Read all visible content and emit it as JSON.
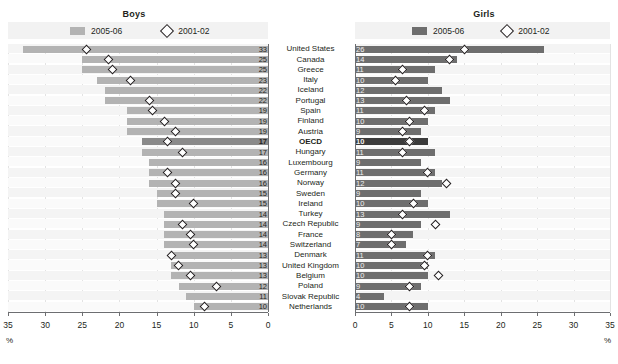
{
  "panels": {
    "boys": {
      "title": "Boys",
      "legend": {
        "bar_label": "2005-06",
        "marker_label": "2001-02",
        "bar_color": "#b3b3b3",
        "marker": "diamond"
      },
      "axis": {
        "ticks": [
          "35",
          "30",
          "25",
          "20",
          "15",
          "10",
          "5",
          "0"
        ],
        "min": 0,
        "max": 35,
        "unit": "%",
        "direction": "right-to-left"
      }
    },
    "girls": {
      "title": "Girls",
      "legend": {
        "bar_label": "2005-06",
        "marker_label": "2001-02",
        "bar_color": "#6e6e6e",
        "marker": "diamond"
      },
      "axis": {
        "ticks": [
          "0",
          "5",
          "10",
          "15",
          "20",
          "25",
          "30",
          "35"
        ],
        "min": 0,
        "max": 35,
        "unit": "%",
        "direction": "left-to-right"
      }
    }
  },
  "chart_data": {
    "type": "bar",
    "xlabel": "%",
    "ylabel": "",
    "xlim": [
      0,
      35
    ],
    "grid": true,
    "legend_position": "top",
    "categories": [
      "United States",
      "Canada",
      "Greece",
      "Italy",
      "Iceland",
      "Portugal",
      "Spain",
      "Finland",
      "Austria",
      "OECD",
      "Hungary",
      "Luxembourg",
      "Germany",
      "Norway",
      "Sweden",
      "Ireland",
      "Turkey",
      "Czech Republic",
      "France",
      "Switzerland",
      "Denmark",
      "United Kingdom",
      "Belgium",
      "Poland",
      "Slovak Republic",
      "Netherlands"
    ],
    "highlight_category": "OECD",
    "series": [
      {
        "name": "Boys 2005-06",
        "panel": "boys",
        "type": "bar",
        "values": [
          33,
          25,
          25,
          23,
          22,
          22,
          19,
          19,
          19,
          17,
          17,
          16,
          16,
          16,
          15,
          15,
          14,
          14,
          14,
          14,
          13,
          13,
          13,
          12,
          11,
          10
        ]
      },
      {
        "name": "Boys 2001-02",
        "panel": "boys",
        "type": "marker",
        "values": [
          24.5,
          21.5,
          21,
          18.5,
          null,
          16,
          15.5,
          14,
          12.5,
          13.5,
          11.5,
          null,
          13.5,
          12.5,
          12.5,
          10,
          null,
          11.5,
          10.5,
          10,
          13,
          12,
          10.5,
          7,
          null,
          8.5
        ]
      },
      {
        "name": "Girls 2005-06",
        "panel": "girls",
        "type": "bar",
        "values": [
          26,
          14,
          11,
          10,
          12,
          13,
          11,
          10,
          9,
          10,
          11,
          9,
          11,
          12,
          9,
          10,
          13,
          9,
          8,
          7,
          11,
          10,
          10,
          9,
          4,
          10
        ]
      },
      {
        "name": "Girls 2001-02",
        "panel": "girls",
        "type": "marker",
        "values": [
          15,
          13,
          6.5,
          5.5,
          null,
          7,
          9.5,
          7.5,
          6.5,
          7.5,
          6.5,
          null,
          10,
          12.5,
          null,
          8,
          6.5,
          11,
          5,
          5,
          10,
          9.5,
          11.5,
          7.5,
          null,
          7.5
        ]
      }
    ]
  }
}
